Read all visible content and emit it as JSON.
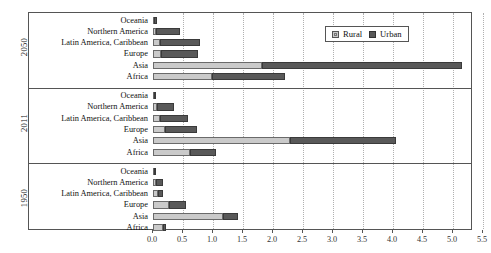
{
  "chart_data": {
    "type": "bar",
    "orientation": "horizontal",
    "stacked": true,
    "title": "",
    "xlabel": "",
    "ylabel": "",
    "xlim": [
      0.0,
      5.5
    ],
    "xticks": [
      "0.0",
      "0.5",
      "1.0",
      "1.5",
      "2.0",
      "2.5",
      "3.0",
      "3.5",
      "4.0",
      "4.5",
      "5.0",
      "5.5"
    ],
    "xtick_values": [
      0.0,
      0.5,
      1.0,
      1.5,
      2.0,
      2.5,
      3.0,
      3.5,
      4.0,
      4.5,
      5.0,
      5.5
    ],
    "grid": "vertical-dotted",
    "legend": {
      "position": "top-right",
      "entries": [
        {
          "name": "Rural",
          "color": "#cacaca"
        },
        {
          "name": "Urban",
          "color": "#595959"
        }
      ]
    },
    "series": [
      {
        "name": "Rural",
        "color": "#cacaca"
      },
      {
        "name": "Urban",
        "color": "#595959"
      }
    ],
    "groups": [
      {
        "label": "2050",
        "categories": [
          "Oceania",
          "Northern America",
          "Latin America, Caribbean",
          "Europe",
          "Asia",
          "Africa"
        ],
        "rows": [
          {
            "category": "Oceania",
            "rural": 0.02,
            "urban": 0.05,
            "total": 0.07
          },
          {
            "category": "Northern America",
            "rural": 0.05,
            "urban": 0.4,
            "total": 0.45
          },
          {
            "category": "Latin America, Caribbean",
            "rural": 0.12,
            "urban": 0.67,
            "total": 0.79
          },
          {
            "category": "Europe",
            "rural": 0.13,
            "urban": 0.62,
            "total": 0.75
          },
          {
            "category": "Asia",
            "rural": 1.82,
            "urban": 3.33,
            "total": 5.15
          },
          {
            "category": "Africa",
            "rural": 0.98,
            "urban": 1.22,
            "total": 2.2
          }
        ]
      },
      {
        "label": "2011",
        "categories": [
          "Oceania",
          "Northern America",
          "Latin America, Caribbean",
          "Europe",
          "Asia",
          "Africa"
        ],
        "rows": [
          {
            "category": "Oceania",
            "rural": 0.01,
            "urban": 0.03,
            "total": 0.04
          },
          {
            "category": "Northern America",
            "rural": 0.06,
            "urban": 0.29,
            "total": 0.35
          },
          {
            "category": "Latin America, Caribbean",
            "rural": 0.12,
            "urban": 0.47,
            "total": 0.59
          },
          {
            "category": "Europe",
            "rural": 0.2,
            "urban": 0.54,
            "total": 0.74
          },
          {
            "category": "Asia",
            "rural": 2.29,
            "urban": 1.76,
            "total": 4.05
          },
          {
            "category": "Africa",
            "rural": 0.62,
            "urban": 0.43,
            "total": 1.05
          }
        ]
      },
      {
        "label": "1950",
        "categories": [
          "Oceania",
          "Northern America",
          "Latin America, Caribbean",
          "Europe",
          "Asia",
          "Africa"
        ],
        "rows": [
          {
            "category": "Oceania",
            "rural": 0.01,
            "urban": 0.01,
            "total": 0.02
          },
          {
            "category": "Northern America",
            "rural": 0.05,
            "urban": 0.11,
            "total": 0.16
          },
          {
            "category": "Latin America, Caribbean",
            "rural": 0.09,
            "urban": 0.07,
            "total": 0.16
          },
          {
            "category": "Europe",
            "rural": 0.27,
            "urban": 0.28,
            "total": 0.55
          },
          {
            "category": "Asia",
            "rural": 1.17,
            "urban": 0.24,
            "total": 1.41
          },
          {
            "category": "Africa",
            "rural": 0.17,
            "urban": 0.05,
            "total": 0.22
          }
        ]
      }
    ]
  }
}
